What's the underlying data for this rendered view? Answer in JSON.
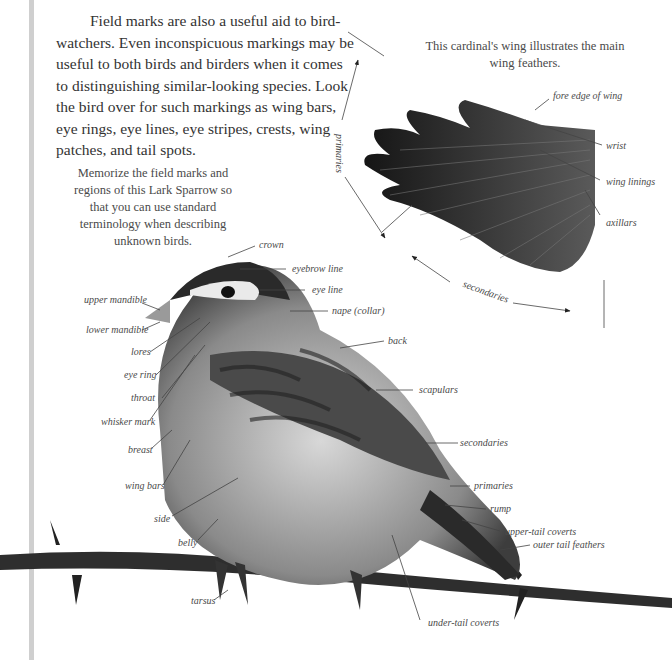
{
  "intro_text": "Field marks are also a useful aid to bird-watchers. Even inconspicuous markings may be useful to both birds and birders when it comes to distinguishing similar-looking species. Look the bird over for such markings as wing bars, eye rings, eye lines, eye stripes, crests, wing patches, and tail spots.",
  "wing_figure": {
    "caption": "This cardinal's wing illustrates the main wing feathers.",
    "labels": {
      "fore_edge": "fore edge of wing",
      "wrist": "wrist",
      "wing_linings": "wing linings",
      "axillars": "axillars",
      "primaries": "primaries",
      "secondaries": "secondaries"
    }
  },
  "bird_figure": {
    "caption": "Memorize the field marks and regions of this Lark Sparrow so that you can use standard terminology when describing unknown birds.",
    "labels": {
      "crown": "crown",
      "eyebrow_line": "eyebrow line",
      "eye_line": "eye line",
      "nape": "nape (collar)",
      "back": "back",
      "scapulars": "scapulars",
      "secondaries": "secondaries",
      "primaries": "primaries",
      "rump": "rump",
      "upper_tail_coverts": "upper-tail coverts",
      "outer_tail_feathers": "outer tail feathers",
      "under_tail_coverts": "under-tail coverts",
      "upper_mandible": "upper mandible",
      "lower_mandible": "lower mandible",
      "lores": "lores",
      "eye_ring": "eye ring",
      "throat": "throat",
      "whisker_mark": "whisker mark",
      "breast": "breast",
      "wing_bars": "wing bars",
      "side": "side",
      "belly": "belly",
      "tarsus": "tarsus"
    }
  }
}
